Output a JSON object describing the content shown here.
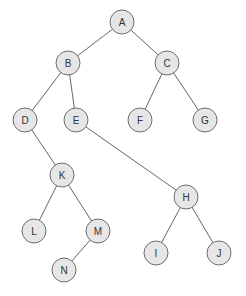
{
  "diagram": {
    "type": "binary-tree",
    "colors": {
      "node_fill": "#e6e6e6",
      "node_stroke": "#6e6e6e",
      "edge": "#555555",
      "text": "#333333"
    },
    "nodes": [
      {
        "id": "A",
        "label": "A",
        "x": 122,
        "y": 22
      },
      {
        "id": "B",
        "label": "B",
        "x": 68,
        "y": 63
      },
      {
        "id": "C",
        "label": "C",
        "x": 167,
        "y": 63
      },
      {
        "id": "D",
        "label": "D",
        "x": 25,
        "y": 120
      },
      {
        "id": "E",
        "label": "E",
        "x": 76,
        "y": 120
      },
      {
        "id": "F",
        "label": "F",
        "x": 140,
        "y": 120
      },
      {
        "id": "G",
        "label": "G",
        "x": 205,
        "y": 120
      },
      {
        "id": "K",
        "label": "K",
        "x": 62,
        "y": 175
      },
      {
        "id": "H",
        "label": "H",
        "x": 186,
        "y": 197
      },
      {
        "id": "L",
        "label": "L",
        "x": 34,
        "y": 231
      },
      {
        "id": "M",
        "label": "M",
        "x": 98,
        "y": 231
      },
      {
        "id": "I",
        "label": "I",
        "x": 156,
        "y": 253
      },
      {
        "id": "J",
        "label": "J",
        "x": 219,
        "y": 253
      },
      {
        "id": "N",
        "label": "N",
        "x": 64,
        "y": 270
      }
    ],
    "edges": [
      [
        "A",
        "B"
      ],
      [
        "A",
        "C"
      ],
      [
        "B",
        "D"
      ],
      [
        "B",
        "E"
      ],
      [
        "C",
        "F"
      ],
      [
        "C",
        "G"
      ],
      [
        "D",
        "K"
      ],
      [
        "E",
        "H"
      ],
      [
        "K",
        "L"
      ],
      [
        "K",
        "M"
      ],
      [
        "M",
        "N"
      ],
      [
        "H",
        "I"
      ],
      [
        "H",
        "J"
      ]
    ]
  }
}
